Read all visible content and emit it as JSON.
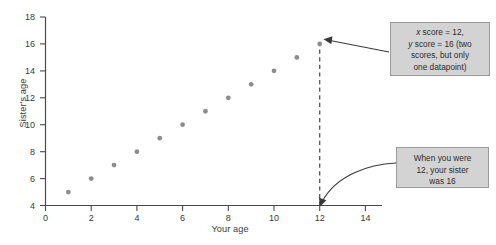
{
  "chart_data": {
    "type": "scatter",
    "title": "",
    "xlabel": "Your age",
    "ylabel": "Sister's age",
    "xlim": [
      0,
      14
    ],
    "ylim": [
      4,
      18
    ],
    "xticks": [
      0,
      2,
      4,
      6,
      8,
      10,
      12,
      14
    ],
    "yticks": [
      4,
      6,
      8,
      10,
      12,
      14,
      16,
      18
    ],
    "grid": false,
    "legend": null,
    "series": [
      {
        "name": "Sister's age vs your age",
        "x": [
          1,
          2,
          3,
          4,
          5,
          6,
          7,
          8,
          9,
          10,
          11,
          12
        ],
        "y": [
          5,
          6,
          7,
          8,
          9,
          10,
          11,
          12,
          13,
          14,
          15,
          16
        ]
      }
    ],
    "marker_color": "#8d8d8d",
    "annotations": [
      {
        "id": "highlight-point",
        "text": "x score = 12, y score = 16 (two scores, but only one datapoint)",
        "lines": [
          "x score = 12,",
          "y score = 16 (two",
          "scores, but only",
          "one datapoint)"
        ],
        "points_to": {
          "x": 12,
          "y": 16
        }
      },
      {
        "id": "axis-callout",
        "text": "When you were 12, your sister was 16",
        "lines": [
          "When you were",
          "12, your sister",
          "was 16"
        ],
        "points_to": {
          "x": 12,
          "y": 4
        }
      }
    ],
    "reference_line": {
      "type": "vertical-dashed",
      "x": 12,
      "from_y": 4,
      "to_y": 16
    }
  },
  "axes": {
    "x_title": "Your age",
    "y_title": "Sister's age",
    "x_tick_labels": [
      "0",
      "2",
      "4",
      "6",
      "8",
      "10",
      "12",
      "14"
    ],
    "y_tick_labels": [
      "4",
      "6",
      "8",
      "10",
      "12",
      "14",
      "16",
      "18"
    ]
  },
  "annotation_boxes": {
    "box1": {
      "line1_prefix": "x",
      "line1_rest": " score = 12,",
      "line2_prefix": "y",
      "line2_rest": " score = 16 (two",
      "line3": "scores, but only",
      "line4": "one datapoint)"
    },
    "box2": {
      "line1": "When you were",
      "line2": "12, your sister",
      "line3": "was 16"
    }
  },
  "colors": {
    "marker": "#8d8d8d",
    "axis": "#4a4a4a",
    "annotation_bg": "#d3d3d3",
    "annotation_border": "#9a9a9a",
    "text": "#3a3a3a"
  }
}
